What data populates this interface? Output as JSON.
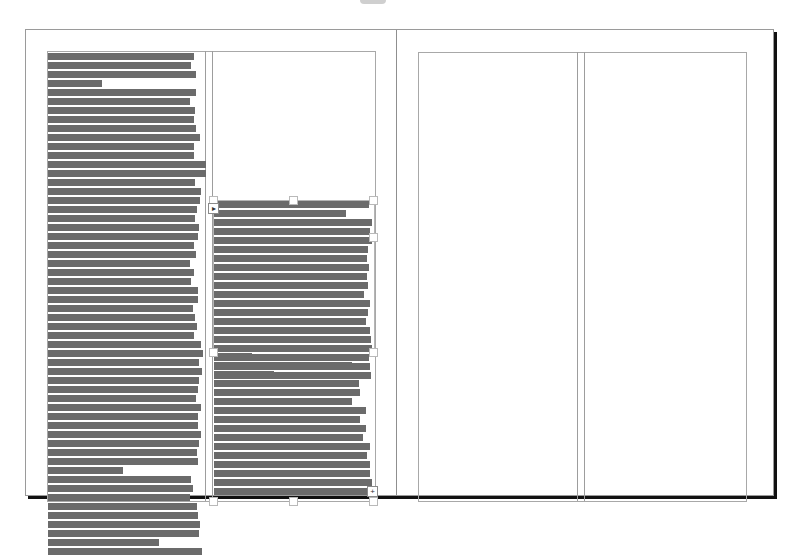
{
  "app": {
    "view": "document-spread"
  },
  "spread": {
    "pages": [
      {
        "name": "left-page",
        "columns": 2
      },
      {
        "name": "right-page",
        "columns": 2
      }
    ]
  },
  "colors": {
    "greek_text": "#6b6b6b",
    "guide": "#a8a8a8",
    "page_border": "#9a9a9a",
    "shadow": "#111111"
  },
  "frames": {
    "left_column": {
      "top": 52,
      "line_height": 9,
      "line_widths": [
        146,
        143,
        148,
        54,
        148,
        142,
        147,
        146,
        148,
        152,
        146,
        146,
        158,
        158,
        147,
        153,
        152,
        149,
        147,
        151,
        150,
        146,
        148,
        142,
        146,
        143,
        150,
        150,
        145,
        147,
        149,
        146,
        153,
        155,
        151,
        154,
        151,
        150,
        148,
        153,
        150,
        150,
        153,
        151,
        149,
        150,
        75,
        143,
        145,
        142,
        149,
        150,
        152,
        151,
        111,
        154
      ],
      "out_port": "▸"
    },
    "right_column_frame1": {
      "top": 200,
      "line_height": 9,
      "line_widths": [
        155,
        132,
        158,
        156,
        158,
        154,
        153,
        155,
        153,
        154,
        150,
        156,
        154,
        152,
        156,
        157,
        158,
        155,
        156,
        157
      ],
      "in_port": "▸"
    },
    "right_column_frame2": {
      "top": 352,
      "line_height": 9,
      "line_widths": [
        38,
        138,
        60,
        145,
        146,
        138,
        152,
        146,
        152,
        149,
        156,
        153,
        156,
        156,
        158,
        157
      ],
      "out_port": "+",
      "overset": true
    }
  }
}
